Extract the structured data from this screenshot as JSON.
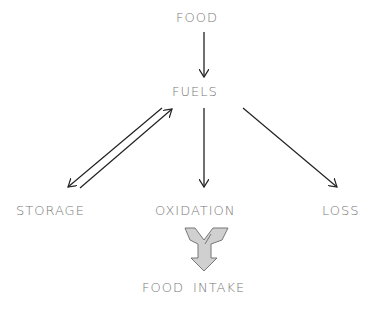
{
  "diagram": {
    "nodes": {
      "food": "FOOD",
      "fuels": "FUELS",
      "storage": "STORAGE",
      "oxidation": "OXIDATION",
      "loss": "LOSS",
      "food_intake": "FOOD INTAKE"
    },
    "edges": [
      {
        "from": "FOOD",
        "to": "FUELS"
      },
      {
        "from": "FUELS",
        "to": "STORAGE"
      },
      {
        "from": "STORAGE",
        "to": "FUELS"
      },
      {
        "from": "FUELS",
        "to": "OXIDATION"
      },
      {
        "from": "FUELS",
        "to": "LOSS"
      }
    ],
    "colors": {
      "text": "#777777",
      "arrow": "#222222",
      "intake_fill": "#cccccc"
    }
  }
}
